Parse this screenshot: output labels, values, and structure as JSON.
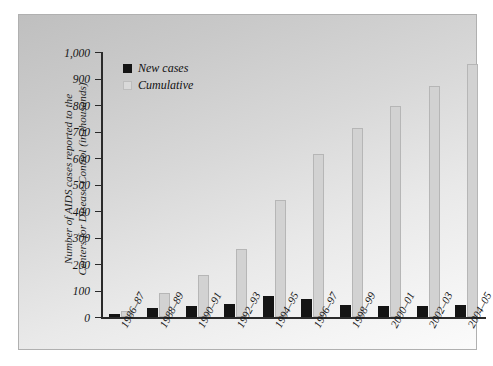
{
  "chart_data": {
    "type": "bar",
    "title": "",
    "subtitle": "",
    "xlabel": "",
    "ylabel": "Number of AIDS cases reported to the Centers for Disease Control (in thousands)",
    "ylabel_lines": [
      "Number of AIDS cases reported to the",
      "Centers for Disease Control (in thousands)"
    ],
    "categories": [
      "1986–87",
      "1988–89",
      "1990–91",
      "1992–93",
      "1994–95",
      "1996–97",
      "1998–99",
      "2000–01",
      "2002–03",
      "2004–05"
    ],
    "series": [
      {
        "name": "New cases",
        "color": "#141414",
        "values": [
          12,
          33,
          43,
          48,
          80,
          68,
          46,
          42,
          42,
          45
        ]
      },
      {
        "name": "Cumulative",
        "color": "#d2d2d2",
        "values": [
          22,
          90,
          160,
          255,
          440,
          615,
          715,
          795,
          870,
          955
        ]
      }
    ],
    "ylim": [
      0,
      1000
    ],
    "ytick_values": [
      0,
      100,
      200,
      300,
      400,
      500,
      600,
      700,
      800,
      900,
      1000
    ],
    "ytick_labels": [
      "0",
      "100",
      "200",
      "300",
      "400",
      "500",
      "600",
      "700",
      "800",
      "900",
      "1,000"
    ],
    "grid": false,
    "legend_position": "top-left"
  },
  "legend": {
    "items": [
      {
        "label": "New cases",
        "swatch": "black-square"
      },
      {
        "label": "Cumulative",
        "swatch": "gray-square"
      }
    ]
  },
  "colors": {
    "new_cases": "#141414",
    "cumulative": "#d2d2d2",
    "cumulative_border": "#b6b6b6",
    "axis": "#2a2a2a",
    "text": "#151515",
    "panel_background": "#d8d8d8",
    "page_background": "#ffffff"
  }
}
